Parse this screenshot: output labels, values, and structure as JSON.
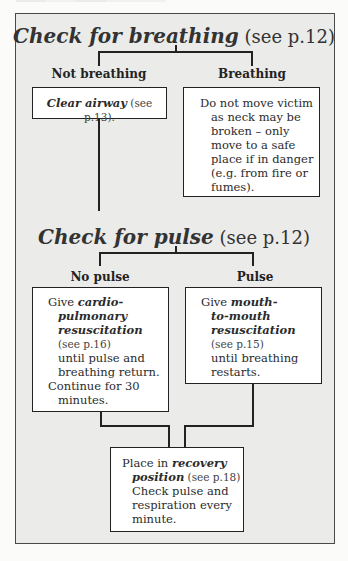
{
  "flowchart": {
    "step1": {
      "title_emphasis": "Check for breathing",
      "title_ref": " (see p.12)",
      "branches": {
        "left_label": "Not breathing",
        "right_label": "Breathing"
      },
      "left_box": {
        "emphasis": "Clear airway",
        "ref": " (see p.13)."
      },
      "right_box": {
        "lines": [
          "Do not move victim",
          "as neck may be",
          "broken – only",
          "move to a safe",
          "place if in danger",
          "(e.g. from fire or",
          "fumes)."
        ]
      }
    },
    "step2": {
      "title_emphasis": "Check for pulse",
      "title_ref": " (see p.12)",
      "branches": {
        "left_label": "No pulse",
        "right_label": "Pulse"
      },
      "left_box": {
        "lead": "Give ",
        "emphasis_lines": [
          "cardio-",
          "pulmonary",
          "resuscitation"
        ],
        "ref": "(see p.16)",
        "body_lines": [
          "until pulse and",
          "breathing return."
        ],
        "continue_line": "Continue for 30",
        "continue_tail": "minutes."
      },
      "right_box": {
        "lead": "Give ",
        "emphasis_lines": [
          "mouth-",
          "to-mouth",
          "resuscitation"
        ],
        "ref": "(see p.15)",
        "body_lines": [
          "until breathing",
          "restarts."
        ]
      }
    },
    "step3": {
      "box": {
        "lead": "Place in ",
        "emphasis_1": "recovery",
        "emphasis_2": "position",
        "ref": " (see p.18)",
        "body_lines": [
          "Check pulse and",
          "respiration every",
          "minute."
        ]
      }
    }
  },
  "colors": {
    "panel_bg": "#ebebea",
    "box_bg": "#ffffff",
    "line": "#222222",
    "text": "#2a2a2a"
  }
}
